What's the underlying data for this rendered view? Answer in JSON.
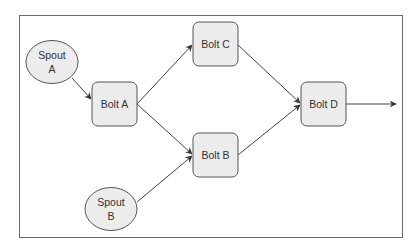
{
  "diagram": {
    "type": "topology",
    "colors": {
      "node_fill": "#ececec",
      "node_stroke": "#555555",
      "edge": "#444444",
      "frame": "#6a6a6a",
      "text": "#333333"
    },
    "nodes": [
      {
        "id": "spout_a",
        "kind": "spout",
        "line1": "Spout",
        "line2": "A"
      },
      {
        "id": "spout_b",
        "kind": "spout",
        "line1": "Spout",
        "line2": "B"
      },
      {
        "id": "bolt_a",
        "kind": "bolt",
        "label": "Bolt A"
      },
      {
        "id": "bolt_b",
        "kind": "bolt",
        "label": "Bolt B"
      },
      {
        "id": "bolt_c",
        "kind": "bolt",
        "label": "Bolt C"
      },
      {
        "id": "bolt_d",
        "kind": "bolt",
        "label": "Bolt D"
      }
    ],
    "edges": [
      {
        "from": "spout_a",
        "to": "bolt_a"
      },
      {
        "from": "bolt_a",
        "to": "bolt_c"
      },
      {
        "from": "bolt_a",
        "to": "bolt_b"
      },
      {
        "from": "spout_b",
        "to": "bolt_b"
      },
      {
        "from": "bolt_c",
        "to": "bolt_d"
      },
      {
        "from": "bolt_b",
        "to": "bolt_d"
      },
      {
        "from": "bolt_d",
        "to": "output"
      }
    ]
  }
}
